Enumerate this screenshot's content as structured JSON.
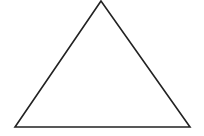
{
  "diagram": {
    "shape": "triangle",
    "kind": "isosceles",
    "stroke_color": "#222222",
    "fill_color": "#ffffff",
    "background": "#ffffff",
    "labels": []
  }
}
